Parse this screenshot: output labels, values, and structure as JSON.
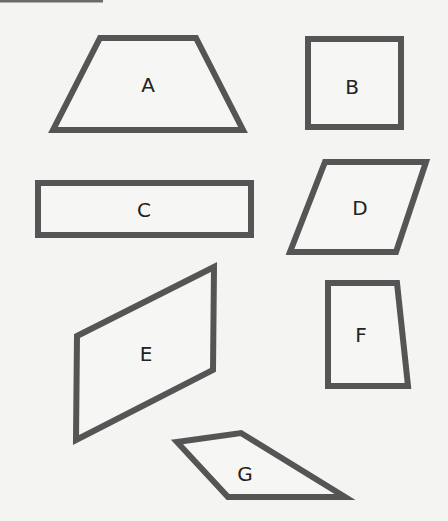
{
  "figure": {
    "stroke_color": "#555555",
    "background_color": "#f4f4f2",
    "shapes": [
      {
        "label": "A",
        "type": "trapezoid"
      },
      {
        "label": "B",
        "type": "square"
      },
      {
        "label": "C",
        "type": "rectangle"
      },
      {
        "label": "D",
        "type": "parallelogram"
      },
      {
        "label": "E",
        "type": "parallelogram"
      },
      {
        "label": "F",
        "type": "trapezoid"
      },
      {
        "label": "G",
        "type": "quadrilateral"
      }
    ]
  }
}
